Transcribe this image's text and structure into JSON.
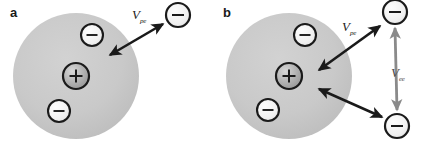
{
  "figure": {
    "width": 426,
    "height": 146,
    "background": "#ffffff"
  },
  "colors": {
    "sphere_fill": "#c9c9c9",
    "sphere_fill_edge": "#bdbdbd",
    "electron_fill": "#f2f2f2",
    "electron_stroke": "#1a1a1a",
    "positron_fill": "#b0b0b0",
    "positron_stroke": "#1a1a1a",
    "arrow_black": "#1a1a1a",
    "arrow_gray": "#8a8a8a",
    "text": "#1a1a1a"
  },
  "panels": [
    {
      "id": "a",
      "label": "a",
      "sphere": {
        "cx": 76,
        "cy": 76,
        "r": 63
      },
      "particles": [
        {
          "name": "positron-center",
          "sign": "+",
          "cx": 76,
          "cy": 76,
          "r": 13
        },
        {
          "name": "electron-inner-top",
          "sign": "−",
          "cx": 92,
          "cy": 35,
          "r": 11
        },
        {
          "name": "electron-inner-bottom",
          "sign": "−",
          "cx": 59,
          "cy": 111,
          "r": 11
        },
        {
          "name": "electron-outer-topright",
          "sign": "−",
          "cx": 178,
          "cy": 15,
          "r": 12
        }
      ],
      "interactions": [
        {
          "name": "v-pe",
          "symbol": "V",
          "subscript": "pe",
          "color": "#1a1a1a",
          "style": "double-head",
          "label_x": 132,
          "label_y": 8,
          "x1": 110,
          "y1": 55,
          "x2": 163,
          "y2": 24
        }
      ]
    },
    {
      "id": "b",
      "label": "b",
      "sphere": {
        "cx": 76,
        "cy": 76,
        "r": 63
      },
      "particles": [
        {
          "name": "positron-center",
          "sign": "+",
          "cx": 76,
          "cy": 76,
          "r": 13
        },
        {
          "name": "electron-inner-top",
          "sign": "−",
          "cx": 92,
          "cy": 35,
          "r": 11
        },
        {
          "name": "electron-inner-bottom",
          "sign": "−",
          "cx": 55,
          "cy": 110,
          "r": 11
        },
        {
          "name": "electron-outer-topright",
          "sign": "−",
          "cx": 182,
          "cy": 12,
          "r": 12
        },
        {
          "name": "electron-outer-bottomright",
          "sign": "−",
          "cx": 184,
          "cy": 126,
          "r": 12
        }
      ],
      "interactions": [
        {
          "name": "v-pe",
          "symbol": "V",
          "subscript": "pe",
          "color": "#1a1a1a",
          "style": "double-head",
          "label_x": 129,
          "label_y": 20,
          "x1": 106,
          "y1": 70,
          "x2": 167,
          "y2": 26
        },
        {
          "name": "v-pe-lower",
          "symbol": "",
          "subscript": "",
          "color": "#1a1a1a",
          "style": "double-head",
          "label_x": null,
          "label_y": null,
          "x1": 106,
          "y1": 89,
          "x2": 169,
          "y2": 117
        },
        {
          "name": "v-ee",
          "symbol": "V",
          "subscript": "ee",
          "color": "#8a8a8a",
          "style": "double-head",
          "label_x": 178,
          "label_y": 66,
          "x1": 182,
          "y1": 28,
          "x2": 184,
          "y2": 110
        }
      ]
    }
  ],
  "legend_meaning": {
    "v_pe": "positron-electron interaction potential",
    "v_ee": "electron-electron interaction potential"
  }
}
